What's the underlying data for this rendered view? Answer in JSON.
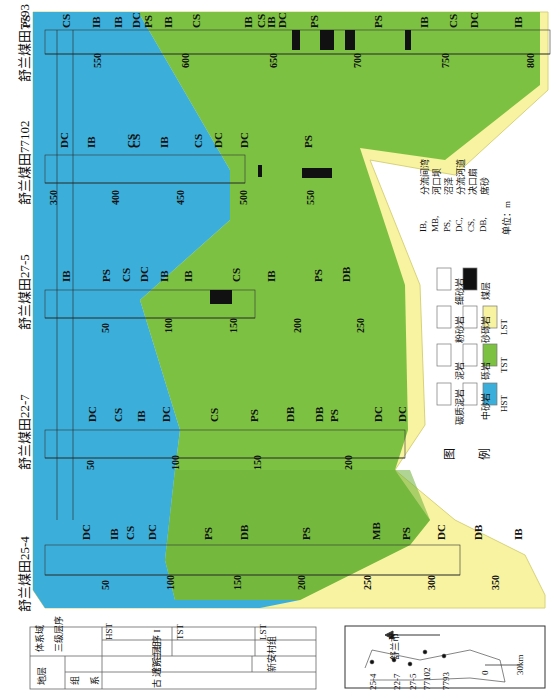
{
  "colors": {
    "HST": "#3BAFDA",
    "TST": "#7DC142",
    "TST_dark": "#6DB13A",
    "LST": "#F7F3A0"
  },
  "wells": [
    {
      "name": "舒兰煤田25-4",
      "depths": [
        "50",
        "100",
        "150",
        "200",
        "250",
        "300",
        "350"
      ],
      "facies": [
        "DC",
        "IB",
        "CS",
        "DC",
        "PS",
        "DB",
        "PS",
        "MB",
        "PS",
        "DC",
        "DB",
        "IB"
      ]
    },
    {
      "name": "舒兰煤田22-7",
      "depths": [
        "50",
        "100",
        "150",
        "200"
      ],
      "facies": [
        "DC",
        "CS",
        "IB",
        "DC",
        "CS",
        "PS",
        "DB",
        "DB",
        "PS",
        "DC",
        "DC"
      ]
    },
    {
      "name": "舒兰煤田27-5",
      "depths": [
        "50",
        "100",
        "150",
        "200",
        "250"
      ],
      "facies": [
        "IB",
        "PS",
        "CS",
        "DC",
        "IB",
        "IB",
        "CS",
        "IB",
        "PS",
        "DB"
      ]
    },
    {
      "name": "舒兰煤田77102",
      "depths": [
        "350",
        "400",
        "450",
        "500",
        "550"
      ],
      "facies": [
        "DC",
        "IB",
        "CS",
        "CS",
        "IB",
        "CS",
        "DC",
        "DC",
        "PS"
      ]
    },
    {
      "name": "舒兰煤田7793",
      "depths": [
        "550",
        "600",
        "650",
        "700",
        "750",
        "800"
      ],
      "facies": [
        "PS",
        "CS",
        "IB",
        "IB",
        "DC",
        "PS",
        "IB",
        "CS",
        "IB",
        "CS",
        "IB",
        "DC",
        "PS",
        "PS",
        "IB",
        "CS",
        "DC",
        "IB"
      ]
    }
  ],
  "legend": {
    "title_1": "图",
    "title_2": "例",
    "lithology": [
      {
        "label": "碳质泥岩",
        "pattern": "c - -"
      },
      {
        "label": "泥岩",
        "pattern": "- - -"
      },
      {
        "label": "粉砂岩",
        "pattern": "····"
      },
      {
        "label": "细砂岩",
        "pattern": "···"
      },
      {
        "label": "中砂岩",
        "pattern": "• •"
      },
      {
        "label": "砾岩",
        "pattern": "o o o"
      },
      {
        "label": "砂砾岩",
        "pattern": "• • •"
      },
      {
        "label": "煤层",
        "pattern": "solid"
      }
    ],
    "systems_tracts": [
      "HST",
      "TST",
      "LST"
    ],
    "facies_codes": [
      {
        "code": "IB,",
        "name": "分流间湾"
      },
      {
        "code": "MB,",
        "name": "河口坝"
      },
      {
        "code": "PS,",
        "name": "沼泽"
      },
      {
        "code": "DC,",
        "name": "分流河道"
      },
      {
        "code": "CS,",
        "name": "决口扇"
      },
      {
        "code": "DB,",
        "name": "席砂"
      }
    ],
    "unit": "单位：m"
  },
  "strat_table": {
    "row_systems_tract": "体系域",
    "row_sequence": "三级层序",
    "row_stratum": "地层",
    "row_formation": "组",
    "row_series": "系",
    "tracts": [
      "HST",
      "TST",
      "LST"
    ],
    "sequence": "层  序  I",
    "formation_1": "舒  兰  组",
    "formation_2": "新安村组",
    "series": "古  近  系"
  },
  "map": {
    "north": "N",
    "town": "舒兰市",
    "wells": [
      "25-4",
      "22-7",
      "27-5",
      "77102",
      "7793"
    ],
    "scale_0": "0",
    "scale_max": "30km"
  }
}
